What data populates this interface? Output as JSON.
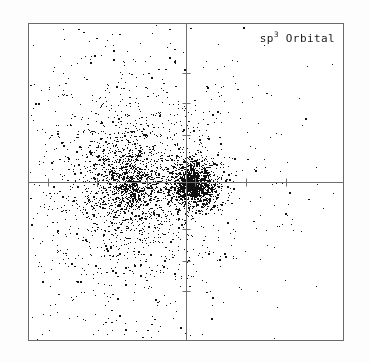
{
  "figure": {
    "label_prefix": "sp",
    "label_superscript": "3",
    "label_suffix": " Orbital",
    "label_full": "sp3 Orbital",
    "background_color": "#fdfdfd",
    "plot_background_color": "#ffffff",
    "frame_color": "#6a6a6a",
    "point_color": "#101010",
    "axis_color": "#6f6f6f"
  },
  "chart_data": {
    "type": "scatter",
    "title": "sp3 Orbital",
    "xlabel": "",
    "ylabel": "",
    "xlim": [
      -1,
      1
    ],
    "ylim": [
      -1,
      1
    ],
    "grid": false,
    "legend": "none",
    "axes": {
      "vertical_axis_x": 0,
      "horizontal_axis_y": 0,
      "tick_spacing_x": 0.315,
      "tick_spacing_y": 0.19,
      "x_ticks": [
        -0.88,
        -0.57,
        -0.25,
        0.06,
        0.38,
        0.64
      ],
      "y_ticks": [
        0.69,
        0.5,
        0.3,
        -0.3,
        -0.5,
        -0.69
      ]
    },
    "total_points": 4200,
    "series": [
      {
        "name": "major-lobe",
        "role": "large diffuse lobe (left)",
        "n_points": 2500,
        "center": [
          -0.355,
          -0.015
        ],
        "sigma": [
          0.185,
          0.215
        ],
        "shape": "gaussian-shell",
        "color": "#101010"
      },
      {
        "name": "minor-lobe",
        "role": "small dense lobe (right of nucleus)",
        "n_points": 1150,
        "center": [
          0.055,
          -0.015
        ],
        "sigma": [
          0.085,
          0.085
        ],
        "shape": "gaussian-peaked",
        "color": "#101010"
      },
      {
        "name": "nucleus-core",
        "role": "very dense core at origin",
        "n_points": 330,
        "center": [
          0.02,
          -0.01
        ],
        "sigma": [
          0.035,
          0.04
        ],
        "shape": "gaussian-peaked",
        "color": "#101010"
      },
      {
        "name": "diffuse-halo",
        "role": "sparse outlier speckle across frame",
        "n_points": 220,
        "center": [
          -0.22,
          -0.02
        ],
        "sigma": [
          0.45,
          0.45
        ],
        "shape": "uniform-tail",
        "color": "#101010"
      }
    ]
  }
}
